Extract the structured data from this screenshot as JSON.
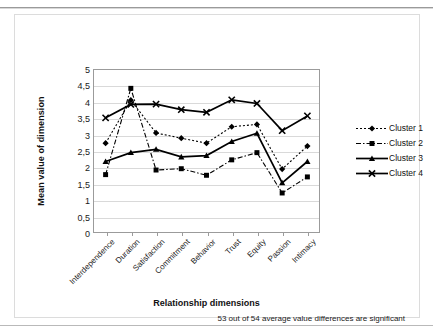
{
  "figure": {
    "footnote": "53 out of 54 average value differences are significant"
  },
  "chart_data": {
    "type": "line",
    "title": "",
    "xlabel": "Relationship dimensions",
    "ylabel": "Mean value of dimension",
    "ylim": [
      0,
      5
    ],
    "ytick_labels": [
      "0",
      "0,5",
      "1",
      "1,5",
      "2",
      "2,5",
      "3",
      "3,5",
      "4",
      "4,5",
      "5"
    ],
    "ytick_values": [
      0,
      0.5,
      1,
      1.5,
      2,
      2.5,
      3,
      3.5,
      4,
      4.5,
      5
    ],
    "grid": "horizontal",
    "legend_position": "right",
    "categories": [
      "Interdependence",
      "Duration",
      "Satisfaction",
      "Commitment",
      "Behavior",
      "Trust",
      "Equity",
      "Passion",
      "Intimacy"
    ],
    "series": [
      {
        "name": "Cluster 1",
        "marker": "diamond",
        "line_style": "dotted",
        "color": "#000000",
        "values": [
          2.74,
          4.05,
          3.05,
          2.89,
          2.74,
          3.24,
          3.31,
          1.95,
          2.65
        ]
      },
      {
        "name": "Cluster 2",
        "marker": "square",
        "line_style": "dash-dot",
        "color": "#000000",
        "values": [
          1.78,
          4.41,
          1.92,
          1.96,
          1.76,
          2.23,
          2.45,
          1.22,
          1.71
        ]
      },
      {
        "name": "Cluster 3",
        "marker": "triangle",
        "line_style": "solid",
        "color": "#000000",
        "values": [
          2.18,
          2.45,
          2.55,
          2.32,
          2.36,
          2.79,
          3.04,
          1.53,
          2.18
        ]
      },
      {
        "name": "Cluster 4",
        "marker": "x",
        "line_style": "solid",
        "color": "#000000",
        "values": [
          3.51,
          3.92,
          3.93,
          3.76,
          3.68,
          4.06,
          3.95,
          3.12,
          3.57
        ]
      }
    ]
  }
}
